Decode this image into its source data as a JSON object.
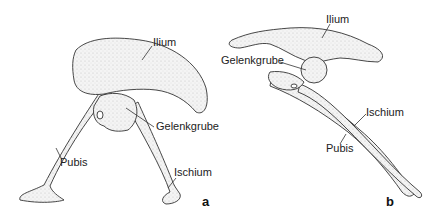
{
  "figure": {
    "panel_a": {
      "letter": "a",
      "labels": {
        "ilium": "Ilium",
        "gelenkgrube": "Gelenkgrube",
        "pubis": "Pubis",
        "ischium": "Ischium"
      }
    },
    "panel_b": {
      "letter": "b",
      "labels": {
        "ilium": "Ilium",
        "gelenkgrube": "Gelenkgrube",
        "ischium": "Ischium",
        "pubis": "Pubis"
      }
    }
  }
}
